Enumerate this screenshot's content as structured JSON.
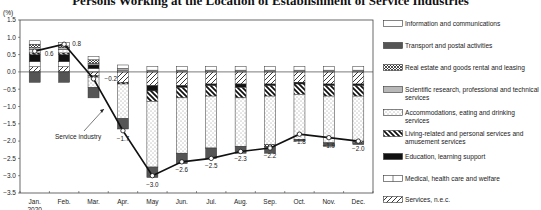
{
  "chart_data": {
    "type": "bar",
    "subtype": "stacked bar with line overlay",
    "title": "Persons Working at the Location of Establishment of Service Industries",
    "ylabel": "(%)",
    "xlabel": "",
    "ylim": [
      -3.5,
      1.5
    ],
    "yticks": [
      "1.5",
      "1.0",
      "0.5",
      "0.0",
      "-0.5",
      "-1.0",
      "-1.5",
      "-2.0",
      "-2.5",
      "-3.0",
      "-3.5"
    ],
    "categories": [
      "Jan.",
      "Feb.",
      "Mar.",
      "Apr.",
      "May",
      "Jun.",
      "Jul.",
      "Aug.",
      "Sep.",
      "Oct.",
      "Nov.",
      "Dec."
    ],
    "year_label": "2020",
    "grid": false,
    "legend_position": "right",
    "series": [
      {
        "name": "Information and communications",
        "values": [
          0.1,
          0.1,
          0.1,
          0.1,
          0.1,
          0.1,
          0.1,
          0.1,
          0.1,
          0.1,
          0.1,
          0.1
        ]
      },
      {
        "name": "Transport and postal activities",
        "values": [
          -0.3,
          -0.3,
          -0.3,
          -0.3,
          -0.3,
          -0.3,
          -0.3,
          -0.2,
          -0.2,
          -0.05,
          -0.1,
          -0.05
        ]
      },
      {
        "name": "Real estate and goods rental and leasing",
        "values": [
          0.1,
          0.05,
          0.1,
          0.0,
          0.0,
          0.0,
          0.0,
          0.0,
          -0.05,
          0.0,
          0.0,
          -0.05
        ]
      },
      {
        "name": "Scientific research, professional and technical services",
        "values": [
          0.05,
          0.05,
          0.05,
          0.05,
          0.05,
          0.05,
          0.05,
          0.05,
          0.05,
          0.05,
          0.05,
          0.05
        ]
      },
      {
        "name": "Accommodations, eating and drinking services",
        "values": [
          0.1,
          0.1,
          -0.3,
          -1.0,
          -1.9,
          -1.6,
          -1.5,
          -1.4,
          -1.4,
          -1.3,
          -1.35,
          -1.3
        ]
      },
      {
        "name": "Living-related and personal services and amusement services",
        "values": [
          0.05,
          0.05,
          -0.05,
          -0.05,
          -0.3,
          -0.3,
          -0.3,
          -0.3,
          -0.3,
          -0.3,
          -0.3,
          -0.3
        ]
      },
      {
        "name": "Education, learning support",
        "values": [
          0.2,
          0.2,
          0.1,
          0.0,
          -0.15,
          -0.05,
          -0.05,
          -0.1,
          -0.05,
          -0.05,
          -0.05,
          -0.05
        ]
      },
      {
        "name": "Medical, health care and welfare",
        "values": [
          0.15,
          0.15,
          0.1,
          0.05,
          0.0,
          0.0,
          0.0,
          0.0,
          0.0,
          0.0,
          0.0,
          0.0
        ]
      },
      {
        "name": "Services, n.e.c.",
        "values": [
          0.15,
          0.15,
          -0.1,
          -0.3,
          -0.4,
          -0.4,
          -0.35,
          -0.35,
          -0.35,
          -0.3,
          -0.35,
          -0.35
        ]
      }
    ],
    "line_series": {
      "name": "Service industry",
      "values": [
        0.6,
        0.8,
        -0.2,
        -1.7,
        -3.0,
        -2.6,
        -2.5,
        -2.3,
        -2.2,
        -1.8,
        -1.9,
        -2.0
      ],
      "labels": [
        "0.6",
        "0.8",
        "−0.2",
        "−1.7",
        "−3.0",
        "−2.6",
        "−2.5",
        "−2.3",
        "−2.2",
        "−1.8",
        "−1.9",
        "−2.0"
      ]
    },
    "annotation": "Service industry"
  },
  "legend": [
    {
      "label": "Information and communications",
      "pattern": "info"
    },
    {
      "label": "Transport and postal activities",
      "pattern": "transport"
    },
    {
      "label": "Real estate and goods rental and leasing",
      "pattern": "realestate"
    },
    {
      "label": "Scientific research, professional and technical services",
      "pattern": "scientific"
    },
    {
      "label": "Accommodations, eating and drinking services",
      "pattern": "accom"
    },
    {
      "label": "Living-related and personal services and amusement services",
      "pattern": "living"
    },
    {
      "label": "Education, learning support",
      "pattern": "education"
    },
    {
      "label": "Medical, health care and welfare",
      "pattern": "medical"
    },
    {
      "label": "Services, n.e.c.",
      "pattern": "nec"
    }
  ],
  "colors": {
    "transport": "#555555",
    "education": "#111111",
    "scientific": "#b8b8b8",
    "axis": "#333333",
    "line": "#111111"
  }
}
